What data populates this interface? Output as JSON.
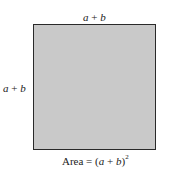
{
  "diagram": {
    "shape": "square",
    "fill_color": "#c9c9c9",
    "border_color": "#2a2a2a",
    "top_side_label": {
      "a": "a",
      "op": " + ",
      "b": "b"
    },
    "left_side_label": {
      "a": "a",
      "op": " + ",
      "b": "b"
    },
    "caption": {
      "prefix": "Area = (",
      "a": "a",
      "op": " + ",
      "b": "b",
      "suffix": ")",
      "exponent": "2"
    }
  }
}
